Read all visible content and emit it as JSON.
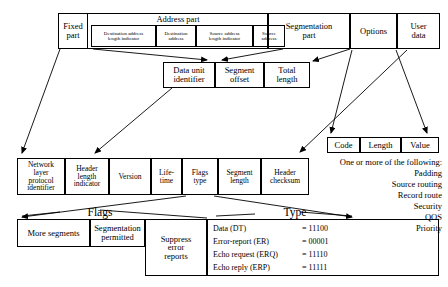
{
  "diagram": {
    "top_row": {
      "fixed_part": "Fixed\npart",
      "address_part_label": "Address part",
      "address_fields": [
        "Destination address\nlength indicator",
        "Destination\naddress",
        "Source address\nlength indicator",
        "Source\naddress"
      ],
      "segmentation_part": "Segmentation\npart",
      "options": "Options",
      "user_data": "User\ndata"
    },
    "segmentation_row": [
      "Data unit\nidentifier",
      "Segment\noffset",
      "Total\nlength"
    ],
    "options_row": [
      "Code",
      "Length",
      "Value"
    ],
    "options_note": {
      "heading": "One or more of the following:",
      "items": [
        "Padding",
        "Source routing",
        "Record route",
        "Security",
        "QOS",
        "Priority"
      ]
    },
    "fixed_part_row": [
      "Network\nlayer\nprotocol\nidentifier",
      "Header\nlength\nindicator",
      "Version",
      "Life-\ntime",
      "Flags\ntype",
      "Segment\nlength",
      "Header\nchecksum"
    ],
    "flags_label": "Flags",
    "flags_row": [
      "More segments",
      "Segmentation\npermitted",
      "Suppress\nerror\nreports"
    ],
    "type_label": "Type",
    "type_rows": [
      {
        "name": "Data (DT)",
        "value": "= 11100"
      },
      {
        "name": "Error-report (ER)",
        "value": "= 00001"
      },
      {
        "name": "Echo request (ERQ)",
        "value": "= 11110"
      },
      {
        "name": "Echo reply (ERP)",
        "value": "= 11111"
      }
    ]
  }
}
